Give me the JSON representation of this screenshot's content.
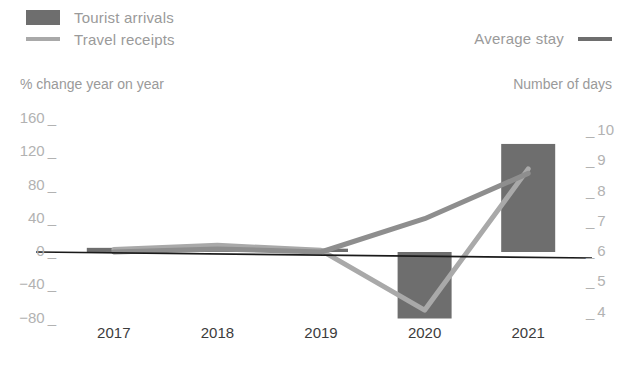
{
  "legend": {
    "items": [
      {
        "label": "Tourist arrivals",
        "marker": "bar-swatch",
        "color": "#6e6e6e"
      },
      {
        "label": "Travel receipts",
        "marker": "line-swatch",
        "color": "#a9a9a9"
      },
      {
        "label": "Average stay",
        "marker": "line-swatch",
        "color": "#6e6e6e"
      }
    ]
  },
  "axes": {
    "left_caption": "% change year on year",
    "right_caption": "Number of days"
  },
  "chart_data": {
    "type": "bar",
    "title": "",
    "subtitle": "",
    "xlabel": "",
    "ylabel": "% change year on year",
    "y2label": "Number of days",
    "grid": false,
    "legend_position": "top",
    "categories": [
      "2017",
      "2018",
      "2019",
      "2020",
      "2021"
    ],
    "ylim": [
      -80,
      160
    ],
    "yticks": [
      160,
      120,
      80,
      40,
      0,
      -40,
      -80
    ],
    "ytick_labels": [
      "160",
      "120",
      "80",
      "40",
      "0",
      "−40",
      "−80"
    ],
    "y2lim": [
      4,
      10
    ],
    "y2ticks": [
      10,
      9,
      8,
      7,
      6,
      5,
      4
    ],
    "y2tick_labels": [
      "10",
      "9",
      "8",
      "7",
      "6",
      "5",
      "4"
    ],
    "series": [
      {
        "name": "Tourist arrivals",
        "type": "bar",
        "axis": "left",
        "color": "#6e6e6e",
        "values": [
          5,
          7,
          4,
          -80,
          130
        ]
      },
      {
        "name": "Travel receipts",
        "type": "line",
        "axis": "left",
        "color": "#a9a9a9",
        "values": [
          3,
          8,
          2,
          -70,
          100
        ]
      },
      {
        "name": "Average stay",
        "type": "line",
        "axis": "right",
        "color": "#8e8e8e",
        "values": [
          6.0,
          6.1,
          6.0,
          7.1,
          8.6
        ]
      }
    ]
  },
  "colors": {
    "bar": "#6e6e6e",
    "line_receipts": "#a9a9a9",
    "line_stay": "#8e8e8e",
    "axis": "#1a1a1a",
    "tick_text": "#b2b2b2",
    "xtick_text": "#3c3c3c",
    "legend_text": "#9a9a9a"
  }
}
